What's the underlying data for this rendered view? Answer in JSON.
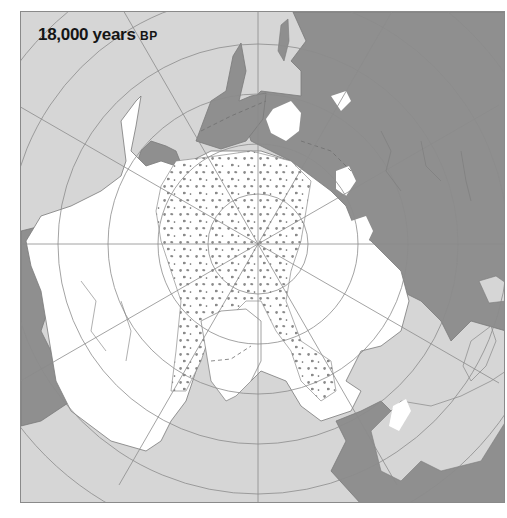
{
  "map": {
    "title": "18,000 years",
    "title_era": "BP",
    "projection": "north-polar azimuthal",
    "colors": {
      "ocean": "#d6d6d6",
      "land": "#8f8f8f",
      "ice_sheet": "#ffffff",
      "sea_ice_pattern": "#8a8a8a",
      "graticule": "#8c8c8c",
      "coastline": "#7a7a7a"
    },
    "legend_features": [
      "ocean",
      "ice-free land",
      "ice sheet",
      "permanent sea ice (stippled)",
      "ice-sheet margin (dashed)"
    ]
  }
}
